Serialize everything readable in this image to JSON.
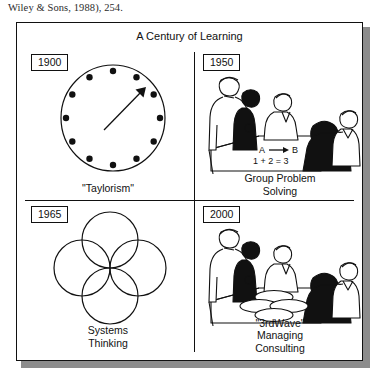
{
  "page": {
    "caption_text": "Wiley & Sons, 1988), 254."
  },
  "figure": {
    "title": "A Century of Learning",
    "panels": [
      {
        "id": "1900",
        "year_label": "1900",
        "caption_lines": [
          "\"Taylorism\""
        ],
        "artwork": "clock-face-with-single-hand",
        "clock": {
          "tick_count": 12,
          "hand_direction": "upper-right",
          "hand_arrow": true
        }
      },
      {
        "id": "1950",
        "year_label": "1950",
        "caption_lines": [
          "Group Problem",
          "Solving"
        ],
        "artwork": "meeting-scene-with-table",
        "board_text": {
          "line1_left": "A",
          "line1_arrow": "→",
          "line1_right": "B",
          "line2": "1 + 2 = 3"
        }
      },
      {
        "id": "1965",
        "year_label": "1965",
        "caption_lines": [
          "Systems",
          "Thinking"
        ],
        "artwork": "four-overlapping-circles",
        "circles": {
          "count": 4,
          "arrangement": "diamond"
        }
      },
      {
        "id": "2000",
        "year_label": "2000",
        "caption_lines": [
          "\"3rdWave\"",
          "Managing",
          "Consulting"
        ],
        "artwork": "meeting-scene-with-overlapping-circles-on-table",
        "table_circles": {
          "count": 4,
          "arrangement": "diamond"
        }
      }
    ]
  },
  "colors": {
    "ink": "#111111",
    "paper": "#ffffff",
    "shadow": "#8c8c8c",
    "skin": "#ffffff",
    "dark_figure": "#111111"
  }
}
